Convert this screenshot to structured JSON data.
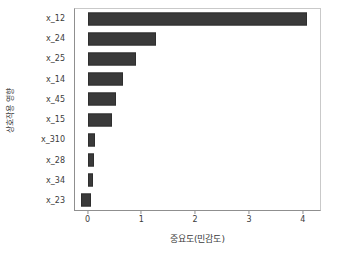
{
  "chart_data": {
    "type": "bar",
    "orientation": "horizontal",
    "title": "",
    "xlabel": "중요도(민감도)",
    "ylabel": "상호작용 영향",
    "categories": [
      "x_12",
      "x_24",
      "x_25",
      "x_14",
      "x_45",
      "x_15",
      "x_310",
      "x_28",
      "x_34",
      "x_23"
    ],
    "values": [
      4.05,
      1.25,
      0.89,
      0.65,
      0.51,
      0.44,
      0.12,
      0.11,
      0.09,
      0.05
    ],
    "bar_starts": [
      0,
      0,
      0,
      0,
      0,
      0,
      0,
      0,
      0,
      -0.13
    ],
    "xlim": [
      -0.25,
      4.3
    ],
    "xticks": [
      0,
      1,
      2,
      3,
      4
    ],
    "xticklabels": [
      "0",
      "1",
      "2",
      "3",
      "4"
    ],
    "grid": false,
    "legend": null,
    "bar_color": "#3a3a3a",
    "background_color": "#ffffff"
  }
}
